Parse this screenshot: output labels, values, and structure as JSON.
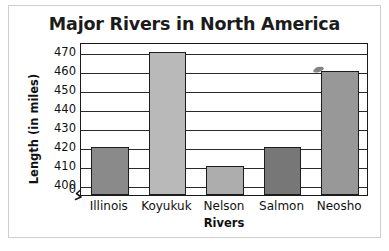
{
  "chart_data": {
    "type": "bar",
    "title": "Major Rivers in North America",
    "xlabel": "Rivers",
    "ylabel": "Length (in miles)",
    "categories": [
      "Illinois",
      "Koyukuk",
      "Nelson",
      "Salmon",
      "Neosho"
    ],
    "values": [
      420,
      470,
      410,
      420,
      460
    ],
    "ylim": [
      395,
      475
    ],
    "yticks": [
      470,
      460,
      450,
      440,
      430,
      420,
      410,
      400
    ],
    "ytick_labels": [
      "470",
      "460",
      "450",
      "440",
      "430",
      "420",
      "410",
      "400"
    ],
    "origin_label": "0",
    "axis_break": true,
    "grid": true,
    "grid_axis": "y",
    "legend": false,
    "bar_colors": [
      "#8a8a8a",
      "#b9b9b9",
      "#adadad",
      "#777777",
      "#989898"
    ],
    "bar_edge_color": "#1d1d1d",
    "plot_border_color": "#1b1b1b",
    "frame_color": "#cfcfcf",
    "background": "#ffffff",
    "text_color": "#111111",
    "annotations": [
      {
        "name": "ink-smudge",
        "kind": "artifact",
        "near": "Neosho",
        "value_approx": 466
      }
    ]
  }
}
